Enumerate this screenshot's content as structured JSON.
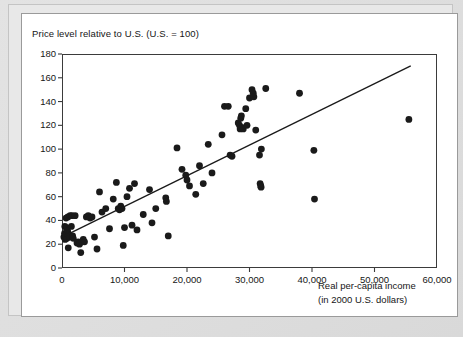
{
  "chart_data": {
    "type": "scatter",
    "title": "Price level relative to U.S. (U.S. = 100)",
    "ylabel": "Price level relative to U.S. (U.S. = 100)",
    "xlabel_line1": "Real per-capita income",
    "xlabel_line2": "(in 2000 U.S. dollars)",
    "xlabel": "Real per-capita income (in 2000 U.S. dollars)",
    "xlim": [
      0,
      60000
    ],
    "ylim": [
      0,
      180
    ],
    "xticks": [
      0,
      10000,
      20000,
      30000,
      40000,
      50000,
      60000
    ],
    "xtick_labels": [
      "0",
      "10,000",
      "20,000",
      "30,000",
      "40,000",
      "50,000",
      "60,000"
    ],
    "yticks": [
      0,
      20,
      40,
      60,
      80,
      100,
      120,
      140,
      160,
      180
    ],
    "ytick_labels": [
      "0",
      "20",
      "40",
      "60",
      "80",
      "100",
      "120",
      "140",
      "160",
      "180"
    ],
    "grid": false,
    "legend": false,
    "marker_color": "#1a1a1a",
    "marker_size": 3.4,
    "trendline": {
      "label": "fitted regression line",
      "color": "#1a1a1a",
      "x_start": 0,
      "y_start": 26,
      "x_end": 55800,
      "y_end": 170
    },
    "points": [
      [
        300,
        26
      ],
      [
        400,
        29
      ],
      [
        450,
        35
      ],
      [
        500,
        24
      ],
      [
        600,
        27
      ],
      [
        650,
        42
      ],
      [
        700,
        34
      ],
      [
        800,
        25
      ],
      [
        900,
        31
      ],
      [
        950,
        43
      ],
      [
        1000,
        17
      ],
      [
        1100,
        28
      ],
      [
        1200,
        26
      ],
      [
        1300,
        44
      ],
      [
        1500,
        35
      ],
      [
        1600,
        44
      ],
      [
        1700,
        27
      ],
      [
        1800,
        25
      ],
      [
        2100,
        44
      ],
      [
        2400,
        21
      ],
      [
        2600,
        22
      ],
      [
        2800,
        20
      ],
      [
        3000,
        13
      ],
      [
        3200,
        22
      ],
      [
        3400,
        24
      ],
      [
        3600,
        22
      ],
      [
        3900,
        43
      ],
      [
        4200,
        44
      ],
      [
        4500,
        42
      ],
      [
        4800,
        43
      ],
      [
        5200,
        26
      ],
      [
        5600,
        16
      ],
      [
        6000,
        64
      ],
      [
        6400,
        47
      ],
      [
        7000,
        50
      ],
      [
        7600,
        33
      ],
      [
        8200,
        58
      ],
      [
        8700,
        72
      ],
      [
        9000,
        50
      ],
      [
        9200,
        49
      ],
      [
        9400,
        52
      ],
      [
        9600,
        50
      ],
      [
        9800,
        19
      ],
      [
        10000,
        34
      ],
      [
        10400,
        60
      ],
      [
        10800,
        67
      ],
      [
        11200,
        36
      ],
      [
        11600,
        71
      ],
      [
        12000,
        32
      ],
      [
        13000,
        45
      ],
      [
        14000,
        66
      ],
      [
        14400,
        38
      ],
      [
        15000,
        50
      ],
      [
        16600,
        59
      ],
      [
        16700,
        56
      ],
      [
        17000,
        27
      ],
      [
        18400,
        101
      ],
      [
        19200,
        83
      ],
      [
        19800,
        78
      ],
      [
        20000,
        74
      ],
      [
        20400,
        69
      ],
      [
        21400,
        62
      ],
      [
        22000,
        86
      ],
      [
        22600,
        71
      ],
      [
        23400,
        104
      ],
      [
        24000,
        80
      ],
      [
        25600,
        112
      ],
      [
        26000,
        136
      ],
      [
        26600,
        136
      ],
      [
        26900,
        95
      ],
      [
        27200,
        94
      ],
      [
        28200,
        122
      ],
      [
        28400,
        120
      ],
      [
        28500,
        117
      ],
      [
        28600,
        126
      ],
      [
        28700,
        128
      ],
      [
        28900,
        118
      ],
      [
        29000,
        117
      ],
      [
        29400,
        134
      ],
      [
        29600,
        120
      ],
      [
        30000,
        143
      ],
      [
        30400,
        150
      ],
      [
        30600,
        147
      ],
      [
        30700,
        144
      ],
      [
        31000,
        116
      ],
      [
        31600,
        95
      ],
      [
        31900,
        100
      ],
      [
        31700,
        71
      ],
      [
        31800,
        69
      ],
      [
        31850,
        68
      ],
      [
        32600,
        151
      ],
      [
        38000,
        147
      ],
      [
        40300,
        99
      ],
      [
        40400,
        58
      ],
      [
        55500,
        125
      ]
    ]
  }
}
